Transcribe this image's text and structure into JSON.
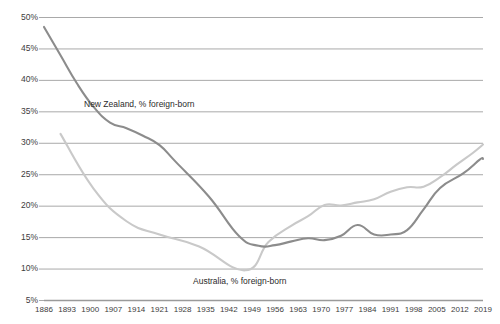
{
  "chart_data": {
    "type": "line",
    "title": "",
    "subtitle": "",
    "xlabel": "",
    "ylabel": "",
    "grid": true,
    "legend_position": "inline-annotation",
    "xlim": [
      1886,
      2019
    ],
    "ylim": [
      5,
      50
    ],
    "ytick_labels": [
      "50%",
      "45%",
      "40%",
      "35%",
      "30%",
      "25%",
      "20%",
      "15%",
      "10%",
      "5%"
    ],
    "ytick_values": [
      50,
      45,
      40,
      35,
      30,
      25,
      20,
      15,
      10,
      5
    ],
    "xtick_labels": [
      "1886",
      "1893",
      "1900",
      "1907",
      "1914",
      "1921",
      "1928",
      "1935",
      "1942",
      "1949",
      "1956",
      "1963",
      "1970",
      "1977",
      "1984",
      "1991",
      "1998",
      "2005",
      "2012",
      "2019"
    ],
    "xtick_values": [
      1886,
      1893,
      1900,
      1907,
      1914,
      1921,
      1928,
      1935,
      1942,
      1949,
      1956,
      1963,
      1970,
      1977,
      1984,
      1991,
      1998,
      2005,
      2012,
      2019
    ],
    "series": [
      {
        "name": "New Zealand, % foreign-born",
        "color": "#8c8c8c",
        "x": [
          1886,
          1891,
          1896,
          1901,
          1906,
          1911,
          1916,
          1921,
          1926,
          1936,
          1945,
          1951,
          1956,
          1961,
          1966,
          1971,
          1976,
          1981,
          1986,
          1991,
          1996,
          2001,
          2006,
          2013,
          2018,
          2019
        ],
        "values": [
          48.5,
          44.0,
          39.5,
          35.8,
          33.3,
          32.4,
          31.2,
          29.7,
          27.0,
          21.5,
          15.3,
          13.7,
          13.8,
          14.4,
          14.9,
          14.6,
          15.3,
          17.0,
          15.5,
          15.5,
          16.2,
          19.5,
          22.9,
          25.2,
          27.4,
          27.5
        ]
      },
      {
        "name": "Australia, % foreign-born",
        "color": "#c9c9c9",
        "x": [
          1891,
          1901,
          1911,
          1921,
          1933,
          1947,
          1954,
          1961,
          1966,
          1971,
          1976,
          1981,
          1986,
          1991,
          1996,
          2001,
          2006,
          2011,
          2016,
          2019
        ],
        "values": [
          31.5,
          22.8,
          17.6,
          15.5,
          13.6,
          9.8,
          14.3,
          16.9,
          18.4,
          20.2,
          20.1,
          20.6,
          21.1,
          22.3,
          23.0,
          23.1,
          24.6,
          26.6,
          28.5,
          29.8
        ]
      }
    ]
  },
  "annotations": {
    "nz_label": "New Zealand, % foreign-born",
    "au_label": "Australia, % foreign-born"
  },
  "colors": {
    "nz_line": "#8c8c8c",
    "au_line": "#c9c9c9",
    "gridline": "#9a9a9a",
    "axis_text": "#3d3d3d"
  }
}
